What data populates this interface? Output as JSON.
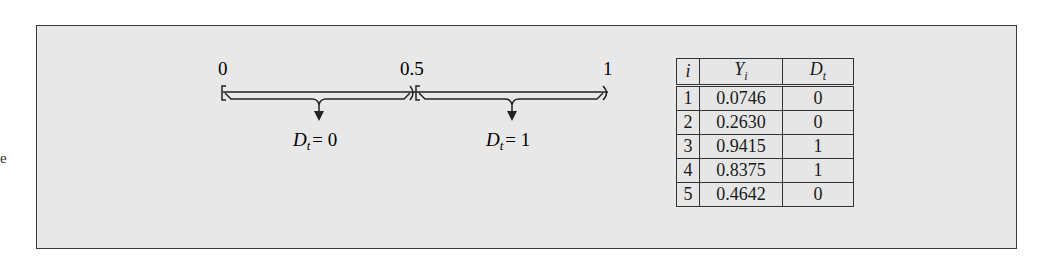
{
  "stray_text": "e",
  "number_line": {
    "ticks": [
      {
        "label": "0",
        "x": 0
      },
      {
        "label": "0.5",
        "x": 0.5
      },
      {
        "label": "1",
        "x": 1
      }
    ],
    "intervals": [
      {
        "range": "[0, 0.5)",
        "outcome_var": "D",
        "outcome_sub": "t",
        "equals": "= 0"
      },
      {
        "range": "[0.5, 1)",
        "outcome_var": "D",
        "outcome_sub": "t",
        "equals": "= 1"
      }
    ]
  },
  "table": {
    "headers": [
      {
        "var": "i",
        "sub": ""
      },
      {
        "var": "Y",
        "sub": "i"
      },
      {
        "var": "D",
        "sub": "t"
      }
    ],
    "rows": [
      {
        "i": "1",
        "Y": "0.0746",
        "D": "0"
      },
      {
        "i": "2",
        "Y": "0.2630",
        "D": "0"
      },
      {
        "i": "3",
        "Y": "0.9415",
        "D": "1"
      },
      {
        "i": "4",
        "Y": "0.8375",
        "D": "1"
      },
      {
        "i": "5",
        "Y": "0.4642",
        "D": "0"
      }
    ]
  },
  "colors": {
    "box_fill": "#e8e8e8",
    "ink": "#1a1a1a"
  }
}
